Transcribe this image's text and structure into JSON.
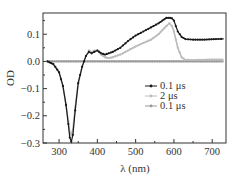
{
  "chart_data": {
    "type": "line",
    "title": "",
    "xlabel": "λ (nm)",
    "ylabel": "OD",
    "xlim": [
      258,
      736
    ],
    "ylim": [
      -0.3,
      0.178
    ],
    "xticks": [
      300,
      400,
      500,
      600,
      700
    ],
    "yticks": [
      -0.3,
      -0.2,
      -0.1,
      0.0,
      0.1
    ],
    "ytick_labels": [
      "−0.3",
      "−0.2",
      "−0.1",
      "0.0",
      "0.1"
    ],
    "xtick_labels": [
      "300",
      "400",
      "500",
      "600",
      "700"
    ],
    "grid": false,
    "legend_position": "center-right",
    "series": [
      {
        "name": "0.1 μs",
        "color": "#1a1a1a",
        "marker": "dot",
        "x": [
          270,
          285,
          300,
          310,
          318,
          324,
          328,
          332,
          336,
          342,
          350,
          360,
          370,
          378,
          385,
          392,
          400,
          410,
          420,
          430,
          440,
          460,
          480,
          500,
          520,
          540,
          560,
          570,
          580,
          590,
          595,
          600,
          610,
          620,
          630,
          650,
          680,
          710,
          730
        ],
        "y": [
          0.0,
          -0.01,
          -0.04,
          -0.09,
          -0.16,
          -0.23,
          -0.28,
          -0.295,
          -0.27,
          -0.18,
          -0.08,
          -0.02,
          0.02,
          0.035,
          0.03,
          0.035,
          0.04,
          0.03,
          0.025,
          0.03,
          0.035,
          0.05,
          0.075,
          0.095,
          0.11,
          0.125,
          0.14,
          0.15,
          0.16,
          0.16,
          0.158,
          0.15,
          0.11,
          0.09,
          0.082,
          0.08,
          0.08,
          0.082,
          0.083
        ]
      },
      {
        "name": "2 μs",
        "color": "#bbbbbb",
        "marker": "dot",
        "x": [
          270,
          285,
          300,
          310,
          318,
          324,
          328,
          332,
          336,
          342,
          350,
          360,
          370,
          378,
          385,
          392,
          400,
          410,
          420,
          430,
          440,
          460,
          480,
          500,
          520,
          540,
          560,
          570,
          580,
          588,
          595,
          600,
          610,
          620,
          630,
          650,
          680,
          710,
          730
        ],
        "y": [
          0.0,
          -0.01,
          -0.04,
          -0.09,
          -0.16,
          -0.22,
          -0.26,
          -0.27,
          -0.25,
          -0.17,
          -0.08,
          -0.02,
          0.02,
          0.04,
          0.035,
          0.04,
          0.04,
          0.025,
          0.015,
          0.012,
          0.015,
          0.025,
          0.04,
          0.055,
          0.068,
          0.08,
          0.1,
          0.115,
          0.13,
          0.14,
          0.13,
          0.11,
          0.05,
          0.015,
          0.006,
          0.005,
          0.006,
          0.007,
          0.007
        ]
      },
      {
        "name": "0.1 μs",
        "color": "#999999",
        "marker": "dot",
        "x": [
          270,
          300,
          350,
          400,
          450,
          500,
          550,
          600,
          650,
          700,
          730
        ],
        "y": [
          0.0,
          0.0,
          0.0,
          0.0,
          0.0,
          0.0,
          0.0,
          0.0,
          0.0,
          0.0,
          0.0
        ]
      }
    ]
  },
  "legend": {
    "items": [
      {
        "label": "0.1 μs",
        "color": "#1a1a1a"
      },
      {
        "label": "2 μs",
        "color": "#bbbbbb"
      },
      {
        "label": "0.1 μs",
        "color": "#999999"
      }
    ]
  }
}
